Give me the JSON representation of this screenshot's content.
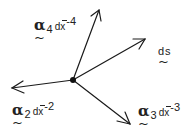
{
  "diagram": {
    "type": "vertex-vectors",
    "center": {
      "x": 73,
      "y": 80
    },
    "stroke_color": "#1a1a1a",
    "arrows": [
      {
        "id": "up",
        "to": {
          "x": 99,
          "y": 10
        }
      },
      {
        "id": "upper-right",
        "to": {
          "x": 145,
          "y": 39
        }
      },
      {
        "id": "left",
        "to": {
          "x": 12,
          "y": 88
        }
      },
      {
        "id": "lower-right",
        "to": {
          "x": 130,
          "y": 124
        }
      }
    ],
    "labels": {
      "a4": {
        "symbol": "α",
        "tilde": "~",
        "subscript": "4",
        "dx": "dx",
        "exponent": "-4"
      },
      "ds": {
        "text": "ds",
        "tilde": "~"
      },
      "a2": {
        "symbol": "α",
        "tilde": "~",
        "subscript": "2",
        "dx": "dx",
        "exponent": "-2"
      },
      "a3": {
        "symbol": "α",
        "tilde": "~",
        "subscript": "3",
        "dx": "dx",
        "exponent": "-3"
      }
    }
  }
}
